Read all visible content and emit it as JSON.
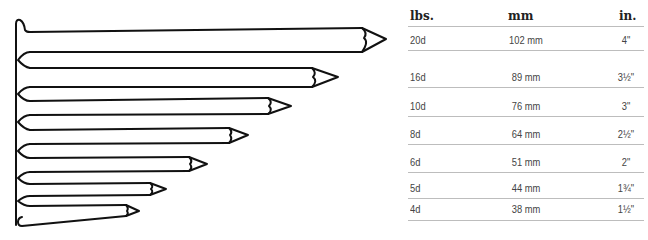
{
  "table": {
    "headers": {
      "lbs": "lbs.",
      "mm": "mm",
      "in": "in."
    },
    "rows": [
      {
        "lbs": "20d",
        "mm": "102 mm",
        "in": "4\""
      },
      {
        "lbs": "16d",
        "mm": "89 mm",
        "in": "3½\""
      },
      {
        "lbs": "10d",
        "mm": "76 mm",
        "in": "3\""
      },
      {
        "lbs": "8d",
        "mm": "64 mm",
        "in": "2½\""
      },
      {
        "lbs": "6d",
        "mm": "51 mm",
        "in": "2\""
      },
      {
        "lbs": "5d",
        "mm": "44 mm",
        "in": "1¾\""
      },
      {
        "lbs": "4d",
        "mm": "38 mm",
        "in": "1½\""
      }
    ]
  },
  "nails": [
    {
      "size": "20d",
      "tip_x": 386
    },
    {
      "size": "16d",
      "tip_x": 338
    },
    {
      "size": "10d",
      "tip_x": 291
    },
    {
      "size": "8d",
      "tip_x": 248
    },
    {
      "size": "6d",
      "tip_x": 207
    },
    {
      "size": "5d",
      "tip_x": 166
    },
    {
      "size": "4d",
      "tip_x": 139
    }
  ],
  "colors": {
    "stroke": "#111111",
    "rule": "#bdbdbd",
    "text": "#444444"
  }
}
